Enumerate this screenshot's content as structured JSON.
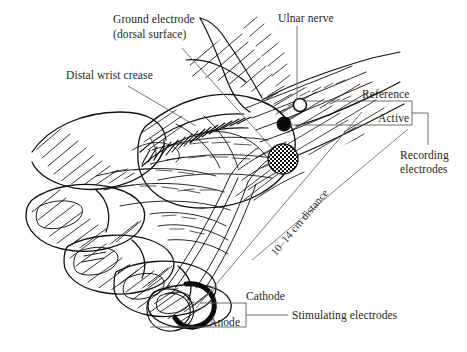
{
  "figure": {
    "ink_color": "#1a1a1a",
    "leader_color": "#5a5a5a",
    "background": "#ffffff"
  },
  "labels": {
    "ground_electrode": "Ground electrode",
    "ground_electrode_sub": "(dorsal surface)",
    "distal_wrist_crease": "Distal wrist crease",
    "ulnar_nerve": "Ulnar nerve",
    "reference": "Reference",
    "active": "Active",
    "recording_electrodes_l1": "Recording",
    "recording_electrodes_l2": "electrodes",
    "distance": "10–14 cm distance",
    "cathode": "Cathode",
    "anode": "Anode",
    "stimulating_electrodes": "Stimulating electrodes"
  },
  "markers": {
    "reference_electrode": "open-circle",
    "active_electrode": "filled-circle",
    "ground_electrode": "mesh-circle",
    "cathode_ring": "ring-electrode-filled",
    "anode_ring": "ring-electrode-open"
  }
}
